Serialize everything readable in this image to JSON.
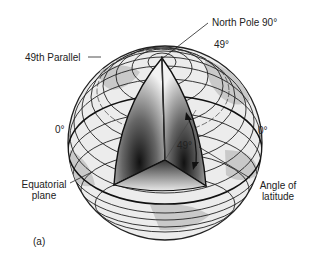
{
  "figure": {
    "panel_label": "(a)",
    "labels": {
      "north_pole": "North Pole  90°",
      "lat_49_top": "49°",
      "parallel_49": "49th Parallel",
      "zero_left": "0°",
      "zero_right": "0°",
      "angle_49": "49°",
      "equatorial_plane_line1": "Equatorial",
      "equatorial_plane_line2": "plane",
      "angle_latitude_line1": "Angle of",
      "angle_latitude_line2": "latitude"
    },
    "colors": {
      "globe_fill": "#e6e6e6",
      "land": "#c4c4c4",
      "lines": "#222222",
      "core_dark": "#111111",
      "background": "#ffffff"
    }
  }
}
